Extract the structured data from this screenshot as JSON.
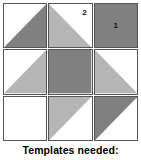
{
  "diagram": {
    "caption": "Templates needed:",
    "colors": {
      "dark": "#808080",
      "light": "#b5b5b5",
      "white": "#ffffff",
      "outline": "#555555",
      "label_text": "#111111",
      "caption_text": "#000000",
      "background": "#ffffff"
    },
    "grid": {
      "rows": 3,
      "columns": 3
    },
    "blocks": [
      {
        "id": "block-r1c1",
        "row": 1,
        "column": 1,
        "pattern": "half-square-triangle",
        "triangle_corner": "lower-right",
        "triangle_shade": "dark",
        "background_shade": "white",
        "label": ""
      },
      {
        "id": "block-r1c2",
        "row": 1,
        "column": 2,
        "pattern": "half-square-triangle",
        "triangle_corner": "lower-left",
        "triangle_shade": "light",
        "background_shade": "white",
        "label": "2",
        "label_position": "top-right"
      },
      {
        "id": "block-r1c3",
        "row": 1,
        "column": 3,
        "pattern": "solid-square",
        "triangle_corner": "",
        "triangle_shade": "dark",
        "background_shade": "dark",
        "label": "1",
        "label_position": "center"
      },
      {
        "id": "block-r2c1",
        "row": 2,
        "column": 1,
        "pattern": "half-square-triangle",
        "triangle_corner": "lower-right",
        "triangle_shade": "light",
        "background_shade": "white",
        "label": ""
      },
      {
        "id": "block-r2c2",
        "row": 2,
        "column": 2,
        "pattern": "solid-square",
        "triangle_corner": "",
        "triangle_shade": "dark",
        "background_shade": "dark",
        "label": ""
      },
      {
        "id": "block-r2c3",
        "row": 2,
        "column": 3,
        "pattern": "half-square-triangle",
        "triangle_corner": "lower-left",
        "triangle_shade": "light",
        "background_shade": "white",
        "label": ""
      },
      {
        "id": "block-r3c1",
        "row": 3,
        "column": 1,
        "pattern": "empty-square",
        "triangle_corner": "",
        "triangle_shade": "white",
        "background_shade": "white",
        "label": ""
      },
      {
        "id": "block-r3c2",
        "row": 3,
        "column": 2,
        "pattern": "half-square-triangle",
        "triangle_corner": "upper-left",
        "triangle_shade": "light",
        "background_shade": "white",
        "label": ""
      },
      {
        "id": "block-r3c3",
        "row": 3,
        "column": 3,
        "pattern": "half-square-triangle",
        "triangle_corner": "upper-left",
        "triangle_shade": "dark",
        "background_shade": "white",
        "label": ""
      }
    ]
  }
}
